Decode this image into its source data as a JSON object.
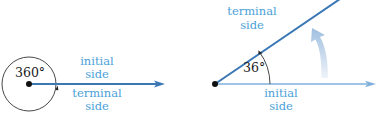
{
  "colors": {
    "ray_dark": "#3a78b5",
    "ray_light": "#7fb0dc",
    "label_blue": "#4a9fd8",
    "rotation_arrow": "#b7cde3",
    "ink": "#1a1a1a"
  },
  "left_figure": {
    "angle_label": "360°",
    "upper_label": {
      "line1": "initial",
      "line2": "side"
    },
    "lower_label": {
      "line1": "terminal",
      "line2": "side"
    }
  },
  "right_figure": {
    "angle_label": "36°",
    "terminal_label": {
      "line1": "terminal",
      "line2": "side"
    },
    "initial_label": {
      "line1": "initial",
      "line2": "side"
    }
  }
}
